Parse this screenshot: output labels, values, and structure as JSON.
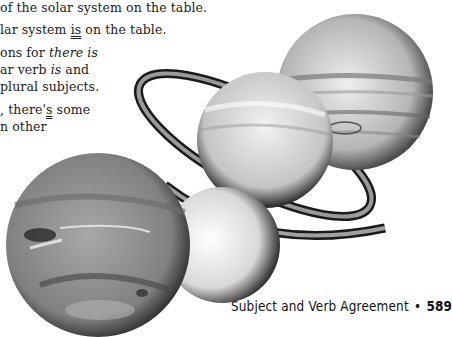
{
  "body_text": {
    "line1": "of the solar system on the table.",
    "line2_pre": "lar system ",
    "line2_underlined": "is",
    "line2_post": " on the table.",
    "line3_pre": "ons for ",
    "line3_italic": "there is",
    "line4_pre": "ar verb ",
    "line4_italic": "is",
    "line4_post": " and",
    "line5": "plural subjects.",
    "line6_pre": ", there'",
    "line6_underlined": "s",
    "line6_post": " some",
    "line7": "n other"
  },
  "footer": {
    "chapter_title": "Subject and Verb Agreement",
    "separator": "•",
    "page_number": "589"
  },
  "illustration": {
    "subject": "planets",
    "items": [
      "jupiter",
      "saturn",
      "uranus",
      "neptune"
    ],
    "colors": {
      "dark": "#1a1a1a",
      "mid": "#8a8a8a",
      "light": "#e8e8e8"
    }
  }
}
